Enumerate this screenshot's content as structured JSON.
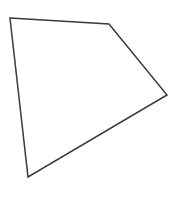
{
  "diagram": {
    "shape": "quadrilateral",
    "stroke_color": "#3a3a3a",
    "fill_color": "#ffffff",
    "stroke_width": 1.5,
    "points": "10,18 109,24 167,95 28,177",
    "vertices": [
      {
        "x": 10,
        "y": 18
      },
      {
        "x": 109,
        "y": 24
      },
      {
        "x": 167,
        "y": 95
      },
      {
        "x": 28,
        "y": 177
      }
    ]
  }
}
